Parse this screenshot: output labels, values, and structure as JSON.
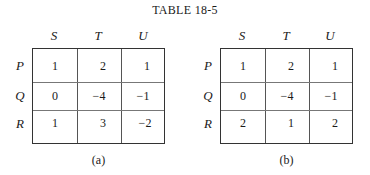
{
  "title": "TABLE 18-5",
  "tables": [
    {
      "caption": "(a)",
      "columns": [
        "S",
        "T",
        "U"
      ],
      "rows": [
        {
          "label": "P",
          "values": [
            "1",
            "2",
            "1"
          ]
        },
        {
          "label": "Q",
          "values": [
            "0",
            "−4",
            "−1"
          ]
        },
        {
          "label": "R",
          "values": [
            "1",
            "3",
            "−2"
          ]
        }
      ]
    },
    {
      "caption": "(b)",
      "columns": [
        "S",
        "T",
        "U"
      ],
      "rows": [
        {
          "label": "P",
          "values": [
            "1",
            "2",
            "1"
          ]
        },
        {
          "label": "Q",
          "values": [
            "0",
            "−4",
            "−1"
          ]
        },
        {
          "label": "R",
          "values": [
            "2",
            "1",
            "2"
          ]
        }
      ]
    }
  ]
}
